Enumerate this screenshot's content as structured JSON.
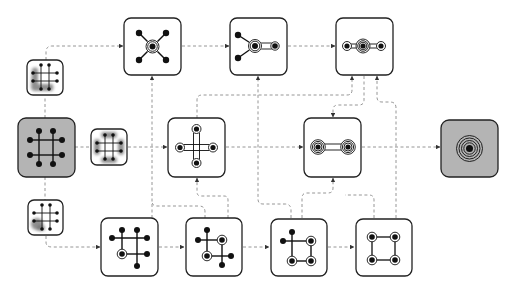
{
  "diagram": {
    "title": "",
    "colors": {
      "box_border": "#222222",
      "box_fill_white": "#ffffff",
      "box_fill_gray": "#b4b4b4",
      "connector": "#8a8a8a",
      "node": "#111111",
      "highlight_blob": "#6a6a6a"
    },
    "nodes": [
      {
        "id": "input",
        "label": "",
        "kind": "input-graph",
        "fill": "gray",
        "content": "3x3 grid graph with 8 endpoint nodes"
      },
      {
        "id": "cluster-top",
        "label": "",
        "kind": "clustering-hint",
        "content": "grid graph with left-bottom L-shaped cluster highlighted"
      },
      {
        "id": "cluster-mid",
        "label": "",
        "kind": "clustering-hint",
        "content": "grid graph with 4 side-pair clusters highlighted"
      },
      {
        "id": "cluster-bottom",
        "label": "",
        "kind": "clustering-hint",
        "content": "grid graph with bottom-left corner cluster highlighted"
      },
      {
        "id": "top-1",
        "label": "",
        "kind": "intermediate",
        "content": "star: one central contracted node with 4 leaves"
      },
      {
        "id": "top-2",
        "label": "",
        "kind": "intermediate",
        "content": "central contracted node with 2 leaves and one ringed neighbor"
      },
      {
        "id": "top-3",
        "label": "",
        "kind": "intermediate",
        "content": "chain of three ringed nodes"
      },
      {
        "id": "mid-1",
        "label": "",
        "kind": "intermediate",
        "content": "cross of four ringed nodes"
      },
      {
        "id": "mid-2",
        "label": "",
        "kind": "intermediate",
        "content": "two multi-ringed nodes joined"
      },
      {
        "id": "bottom-1",
        "label": "",
        "kind": "intermediate",
        "content": "grid with one ringed node"
      },
      {
        "id": "bottom-2",
        "label": "",
        "kind": "intermediate",
        "content": "graph with two ringed nodes"
      },
      {
        "id": "bottom-3",
        "label": "",
        "kind": "intermediate",
        "content": "graph with three ringed nodes"
      },
      {
        "id": "bottom-4",
        "label": "",
        "kind": "intermediate",
        "content": "square of four ringed nodes"
      },
      {
        "id": "output",
        "label": "",
        "kind": "output",
        "fill": "gray",
        "content": "single node with concentric rings"
      }
    ],
    "edges": [
      {
        "from": "input",
        "to": "cluster-top"
      },
      {
        "from": "input",
        "to": "cluster-mid"
      },
      {
        "from": "input",
        "to": "cluster-bottom"
      },
      {
        "from": "cluster-top",
        "to": "top-1"
      },
      {
        "from": "top-1",
        "to": "top-2"
      },
      {
        "from": "top-2",
        "to": "top-3"
      },
      {
        "from": "cluster-mid",
        "to": "mid-1"
      },
      {
        "from": "mid-1",
        "to": "mid-2"
      },
      {
        "from": "mid-2",
        "to": "output"
      },
      {
        "from": "cluster-bottom",
        "to": "bottom-1"
      },
      {
        "from": "bottom-1",
        "to": "bottom-2"
      },
      {
        "from": "bottom-2",
        "to": "bottom-3"
      },
      {
        "from": "bottom-3",
        "to": "bottom-4"
      },
      {
        "from": "bottom-1",
        "to": "top-1"
      },
      {
        "from": "bottom-2",
        "to": "mid-1"
      },
      {
        "from": "bottom-2",
        "to": "top-2"
      },
      {
        "from": "bottom-3",
        "to": "mid-2"
      },
      {
        "from": "bottom-4",
        "to": "mid-2"
      },
      {
        "from": "bottom-4",
        "to": "top-3"
      },
      {
        "from": "mid-1",
        "to": "top-3"
      },
      {
        "from": "top-3",
        "to": "mid-2"
      },
      {
        "from": "top-3",
        "to": "output"
      }
    ]
  }
}
